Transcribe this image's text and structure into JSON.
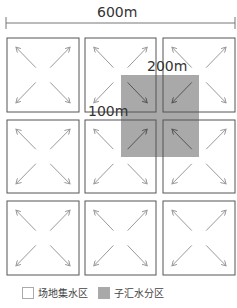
{
  "dimension": {
    "total_width": "600m",
    "gray_width": "200m",
    "half_offset": "100m"
  },
  "grid": {
    "rows": 3,
    "cols": 3
  },
  "legend": [
    {
      "label": "场地集水区",
      "color": "#ffffff"
    },
    {
      "label": "子汇水分区",
      "color": "#a9a9a9"
    }
  ],
  "colors": {
    "box_stroke": "#555555",
    "arrow": "#999999",
    "gray_fill": "#a9a9a9"
  }
}
